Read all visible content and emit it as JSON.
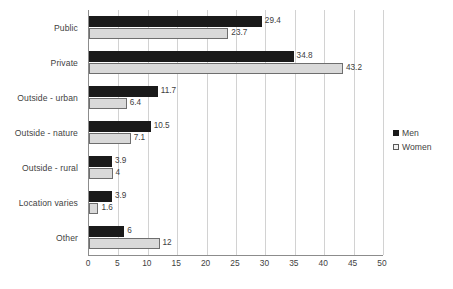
{
  "chart_data": {
    "type": "bar",
    "orientation": "horizontal",
    "title": "",
    "subtitle": "",
    "xlabel": "",
    "ylabel": "",
    "categories": [
      "Public",
      "Private",
      "Outside - urban",
      "Outside - nature",
      "Outside - rural",
      "Location varies",
      "Other"
    ],
    "series": [
      {
        "name": "Men",
        "color": "#1a1a1a",
        "values": [
          29.4,
          34.8,
          11.7,
          10.5,
          3.9,
          3.9,
          6
        ],
        "labels": [
          "29.4",
          "34.8",
          "11.7",
          "10.5",
          "3.9",
          "3.9",
          "6"
        ]
      },
      {
        "name": "Women",
        "color": "#d9d9d9",
        "values": [
          23.7,
          43.2,
          6.4,
          7.1,
          4,
          1.6,
          12
        ],
        "labels": [
          "23.7",
          "43.2",
          "6.4",
          "7.1",
          "4",
          "1.6",
          "12"
        ]
      }
    ],
    "xlim": [
      0,
      50
    ],
    "xticks": [
      0,
      5,
      10,
      15,
      20,
      25,
      30,
      35,
      40,
      45,
      50
    ],
    "xtick_labels": [
      "0",
      "5",
      "10",
      "15",
      "20",
      "25",
      "30",
      "35",
      "40",
      "45",
      "50"
    ],
    "grid": "vertical",
    "legend_position": "right",
    "legend": [
      "Men",
      "Women"
    ],
    "data_labels": true
  }
}
